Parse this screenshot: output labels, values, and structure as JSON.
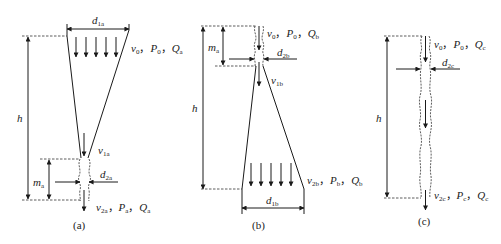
{
  "figure": {
    "panels": [
      {
        "id": "a",
        "caption": "(a)",
        "labels": {
          "top_diameter": {
            "main": "d",
            "sub": "1a"
          },
          "top_state": [
            {
              "main": "v",
              "sub": "0"
            },
            {
              "sep": "，"
            },
            {
              "main": "P",
              "sub": "0"
            },
            {
              "sep": "，"
            },
            {
              "main": "Q",
              "sub": "a"
            }
          ],
          "height": "h",
          "mid_velocity": {
            "main": "v",
            "sub": "1a"
          },
          "nozzle_length": {
            "main": "m",
            "sub": "a"
          },
          "nozzle_diameter": {
            "main": "d",
            "sub": "2a"
          },
          "bottom_state": [
            {
              "main": "v",
              "sub": "2a"
            },
            {
              "sep": "，"
            },
            {
              "main": "P",
              "sub": "a"
            },
            {
              "sep": "，"
            },
            {
              "main": "Q",
              "sub": "a"
            }
          ]
        }
      },
      {
        "id": "b",
        "caption": "(b)",
        "labels": {
          "top_state": [
            {
              "main": "v",
              "sub": "0"
            },
            {
              "sep": "，"
            },
            {
              "main": "P",
              "sub": "0"
            },
            {
              "sep": "，"
            },
            {
              "main": "Q",
              "sub": "b"
            }
          ],
          "nozzle_length": {
            "main": "m",
            "sub": "a"
          },
          "nozzle_diameter": {
            "main": "d",
            "sub": "2b"
          },
          "mid_velocity": {
            "main": "v",
            "sub": "1b"
          },
          "height": "h",
          "bottom_state": [
            {
              "main": "v",
              "sub": "2b"
            },
            {
              "sep": "，"
            },
            {
              "main": "P",
              "sub": "b"
            },
            {
              "sep": "，"
            },
            {
              "main": "Q",
              "sub": "b"
            }
          ],
          "bottom_diameter": {
            "main": "d",
            "sub": "1b"
          }
        }
      },
      {
        "id": "c",
        "caption": "(c)",
        "labels": {
          "top_state": [
            {
              "main": "v",
              "sub": "0"
            },
            {
              "sep": "，"
            },
            {
              "main": "P",
              "sub": "0"
            },
            {
              "sep": "，"
            },
            {
              "main": "Q",
              "sub": "c"
            }
          ],
          "nozzle_diameter": {
            "main": "d",
            "sub": "2c"
          },
          "height": "h",
          "bottom_state": [
            {
              "main": "v",
              "sub": "2c"
            },
            {
              "sep": "，"
            },
            {
              "main": "P",
              "sub": "c"
            },
            {
              "sep": "，"
            },
            {
              "main": "Q",
              "sub": "c"
            }
          ]
        }
      }
    ]
  }
}
